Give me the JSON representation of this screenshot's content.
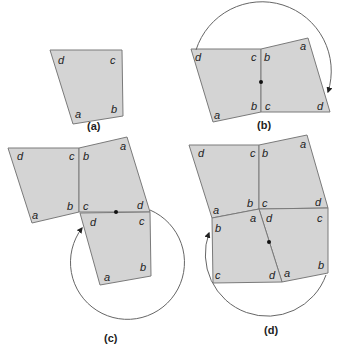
{
  "panels": [
    {
      "id": "a",
      "caption": "(a)"
    },
    {
      "id": "b",
      "caption": "(b)"
    },
    {
      "id": "c",
      "caption": "(c)"
    },
    {
      "id": "d",
      "caption": "(d)"
    }
  ],
  "labels": {
    "a": "a",
    "b": "b",
    "c": "c",
    "d": "d"
  },
  "colors": {
    "fill": "#d4d4d4",
    "stroke": "#7a7a7a"
  }
}
